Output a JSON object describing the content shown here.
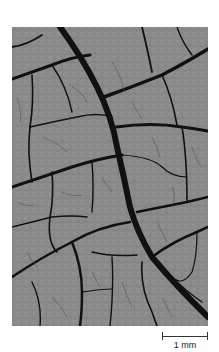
{
  "figure": {
    "background_color": "#8a8a8a",
    "vein_color": "#111111",
    "scale_bar": {
      "label": "1 mm"
    }
  }
}
